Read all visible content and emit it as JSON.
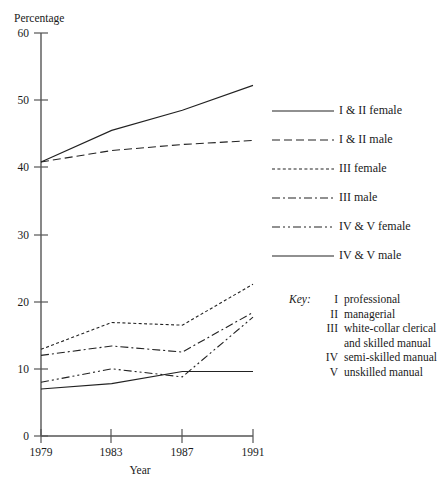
{
  "chart_data": {
    "type": "line",
    "title": "",
    "ylabel": "Percentage",
    "xlabel": "Year",
    "x": [
      1979,
      1983,
      1987,
      1991
    ],
    "xticklabels": [
      "1979",
      "1983",
      "1987",
      "1991"
    ],
    "yticks": [
      0,
      10,
      20,
      30,
      40,
      50,
      60
    ],
    "yticklabels": [
      "0",
      "10",
      "20",
      "30",
      "40",
      "50",
      "60"
    ],
    "ylim": [
      0,
      60
    ],
    "grid": false,
    "legend_position": "right",
    "series": [
      {
        "name": "I  & II female",
        "style": "solid",
        "values": [
          40.8,
          45.5,
          48.5,
          52.2
        ]
      },
      {
        "name": "I & II male",
        "style": "dashed",
        "values": [
          40.8,
          42.5,
          43.4,
          44.0
        ]
      },
      {
        "name": "III female",
        "style": "dotted",
        "values": [
          12.9,
          16.9,
          16.5,
          22.6
        ]
      },
      {
        "name": "III male",
        "style": "dashdot",
        "values": [
          12.0,
          13.4,
          12.5,
          18.4
        ]
      },
      {
        "name": "IV & V female",
        "style": "dashdotdot",
        "values": [
          8.0,
          10.0,
          8.8,
          17.7
        ]
      },
      {
        "name": "IV & V male",
        "style": "solid",
        "values": [
          7.0,
          7.8,
          9.6,
          9.6
        ]
      }
    ]
  },
  "legend": {
    "items": [
      {
        "label": "I  & II female",
        "style": "solid"
      },
      {
        "label": "I & II male",
        "style": "dashed"
      },
      {
        "label": "III female",
        "style": "dotted"
      },
      {
        "label": "III male",
        "style": "dashdot"
      },
      {
        "label": "IV & V female",
        "style": "dashdotdot"
      },
      {
        "label": "IV & V male",
        "style": "solid"
      }
    ]
  },
  "key": {
    "title": "Key:",
    "entries": [
      {
        "numeral": "I",
        "description": "professional",
        "continuation": ""
      },
      {
        "numeral": "II",
        "description": "managerial",
        "continuation": ""
      },
      {
        "numeral": "III",
        "description": "white-collar clerical",
        "continuation": "and skilled manual"
      },
      {
        "numeral": "IV",
        "description": "semi-skilled manual",
        "continuation": ""
      },
      {
        "numeral": "V",
        "description": "unskilled manual",
        "continuation": ""
      }
    ]
  }
}
